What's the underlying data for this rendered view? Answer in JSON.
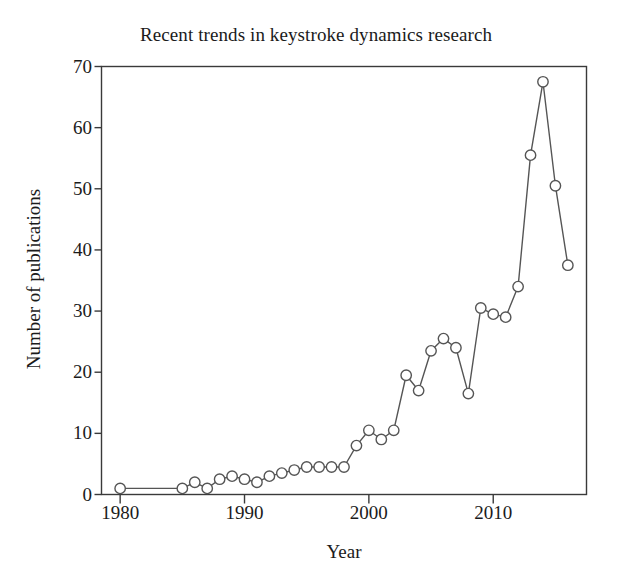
{
  "chart_data": {
    "type": "line",
    "title": "Recent trends in keystroke dynamics research",
    "xlabel": "Year",
    "ylabel": "Number of publications",
    "xlim": [
      1978.5,
      2017.5
    ],
    "ylim": [
      0,
      70
    ],
    "grid": false,
    "legend": null,
    "marker": "open-circle",
    "line_color": "#555555",
    "marker_color": "#555555",
    "xticks": [
      1980,
      1990,
      2000,
      2010
    ],
    "xtick_labels": [
      "1980",
      "1990",
      "2000",
      "2010"
    ],
    "yticks": [
      0,
      10,
      20,
      30,
      40,
      50,
      60,
      70
    ],
    "ytick_labels": [
      "0",
      "10",
      "20",
      "30",
      "40",
      "50",
      "60",
      "70"
    ],
    "x": [
      1980,
      1985,
      1986,
      1987,
      1988,
      1989,
      1990,
      1991,
      1992,
      1993,
      1994,
      1995,
      1996,
      1997,
      1998,
      1999,
      2000,
      2001,
      2002,
      2003,
      2004,
      2005,
      2006,
      2007,
      2008,
      2009,
      2010,
      2011,
      2012,
      2013,
      2014,
      2015,
      2016
    ],
    "values": [
      1,
      1,
      2,
      1,
      2.5,
      3,
      2.5,
      2,
      3,
      3.5,
      4,
      4.5,
      4.5,
      4.5,
      4.5,
      8,
      10.5,
      9,
      10.5,
      19.5,
      17,
      23.5,
      25.5,
      24,
      16.5,
      30.5,
      29.5,
      29,
      34,
      55.5,
      67.5,
      50.5,
      37.5
    ],
    "series": [
      {
        "name": "Number of publications",
        "values": [
          1,
          1,
          2,
          1,
          2.5,
          3,
          2.5,
          2,
          3,
          3.5,
          4,
          4.5,
          4.5,
          4.5,
          4.5,
          8,
          10.5,
          9,
          10.5,
          19.5,
          17,
          23.5,
          25.5,
          24,
          16.5,
          30.5,
          29.5,
          29,
          34,
          55.5,
          67.5,
          50.5,
          37.5
        ]
      }
    ]
  }
}
